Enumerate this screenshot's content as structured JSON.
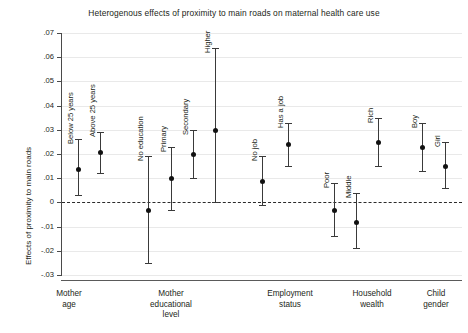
{
  "chart_data": {
    "type": "scatter",
    "title": "Heterogenous effects of proximity to main roads on maternal health care use",
    "xlabel": "",
    "ylabel": "Effects of proximity to main roads",
    "ylim": [
      -0.03,
      0.07
    ],
    "yticks": [
      ".07",
      ".06",
      ".05",
      ".04",
      ".03",
      ".02",
      ".01",
      "0",
      "-.01",
      "-.02",
      "-.03"
    ],
    "ytick_values": [
      0.07,
      0.06,
      0.05,
      0.04,
      0.03,
      0.02,
      0.01,
      0,
      -0.01,
      -0.02,
      -0.03
    ],
    "grid": true,
    "legend": "none",
    "reference_line": 0,
    "groups": [
      {
        "name": "Mother age",
        "label_lines": [
          "Mother",
          "age"
        ],
        "points": [
          {
            "label": "Below 25 years",
            "value": 0.014,
            "ci_low": 0.003,
            "ci_high": 0.026
          },
          {
            "label": "Above 25 years",
            "value": 0.021,
            "ci_low": 0.012,
            "ci_high": 0.029
          }
        ]
      },
      {
        "name": "Mother educational level",
        "label_lines": [
          "Mother",
          "educational",
          "level"
        ],
        "points": [
          {
            "label": "No education",
            "value": -0.003,
            "ci_low": -0.025,
            "ci_high": 0.019
          },
          {
            "label": "Primary",
            "value": 0.01,
            "ci_low": -0.003,
            "ci_high": 0.023
          },
          {
            "label": "Secondary",
            "value": 0.02,
            "ci_low": 0.01,
            "ci_high": 0.03
          },
          {
            "label": "Higher",
            "value": 0.03,
            "ci_low": 0.0,
            "ci_high": 0.064
          }
        ]
      },
      {
        "name": "Employment status",
        "label_lines": [
          "Employment",
          "status"
        ],
        "points": [
          {
            "label": "No job",
            "value": 0.009,
            "ci_low": -0.001,
            "ci_high": 0.019
          },
          {
            "label": "Has a job",
            "value": 0.024,
            "ci_low": 0.015,
            "ci_high": 0.033
          }
        ]
      },
      {
        "name": "Household wealth",
        "label_lines": [
          "Household",
          "wealth"
        ],
        "points": [
          {
            "label": "Poor",
            "value": -0.003,
            "ci_low": -0.014,
            "ci_high": 0.008
          },
          {
            "label": "Middle",
            "value": -0.008,
            "ci_low": -0.019,
            "ci_high": 0.004
          },
          {
            "label": "Rich",
            "value": 0.025,
            "ci_low": 0.015,
            "ci_high": 0.035
          }
        ]
      },
      {
        "name": "Child gender",
        "label_lines": [
          "Boy",
          "Girl"
        ],
        "group_lines": [
          "Child",
          "gender"
        ],
        "points": [
          {
            "label": "Boy",
            "value": 0.023,
            "ci_low": 0.013,
            "ci_high": 0.033
          },
          {
            "label": "Girl",
            "value": 0.015,
            "ci_low": 0.006,
            "ci_high": 0.025
          }
        ]
      }
    ]
  },
  "colors": {
    "marker": "#111111",
    "whisker": "#3a3a3a",
    "gridline": "#e9e9e9",
    "axis": "#4a4a4a",
    "zero_line": "#2b2b2b",
    "background": "#ffffff"
  }
}
